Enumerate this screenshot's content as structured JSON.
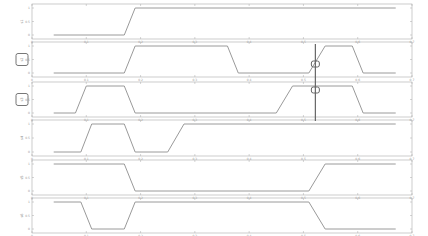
{
  "chart_data": [
    {
      "type": "line",
      "ylabel": "s1",
      "xlim": [
        0,
        0.7
      ],
      "ylim": [
        0,
        1
      ],
      "yticks": [
        "0",
        "0.5",
        "1"
      ],
      "xticks": [
        "0",
        "0.1",
        "0.2",
        "0.3",
        "0.4",
        "0.5",
        "0.6",
        "0.7"
      ],
      "x": [
        0.04,
        0.17,
        0.19,
        0.67
      ],
      "y": [
        0,
        0,
        1,
        1
      ],
      "boxed_label": false
    },
    {
      "type": "line",
      "ylabel": "s2",
      "xlim": [
        0,
        0.7
      ],
      "ylim": [
        0,
        1
      ],
      "yticks": [
        "0",
        "0.5",
        "1"
      ],
      "xticks": [
        "0",
        "0.1",
        "0.2",
        "0.3",
        "0.4",
        "0.5",
        "0.6",
        "0.7"
      ],
      "x": [
        0.04,
        0.17,
        0.19,
        0.36,
        0.38,
        0.51,
        0.54,
        0.59,
        0.61,
        0.67
      ],
      "y": [
        0,
        0,
        1,
        1,
        0,
        0,
        1,
        1,
        0,
        0
      ],
      "boxed_label": true
    },
    {
      "type": "line",
      "ylabel": "s3",
      "xlim": [
        0,
        0.7
      ],
      "ylim": [
        0,
        1
      ],
      "yticks": [
        "0",
        "0.5",
        "1"
      ],
      "xticks": [
        "0",
        "0.1",
        "0.2",
        "0.3",
        "0.4",
        "0.5",
        "0.6",
        "0.7"
      ],
      "x": [
        0.04,
        0.08,
        0.1,
        0.17,
        0.19,
        0.45,
        0.48,
        0.59,
        0.61,
        0.67
      ],
      "y": [
        0,
        0,
        1,
        1,
        0,
        0,
        1,
        1,
        0,
        0
      ],
      "boxed_label": true
    },
    {
      "type": "line",
      "ylabel": "s4",
      "xlim": [
        0,
        0.7
      ],
      "ylim": [
        0,
        1
      ],
      "yticks": [
        "0",
        "0.5",
        "1"
      ],
      "xticks": [
        "0",
        "0.1",
        "0.2",
        "0.3",
        "0.4",
        "0.5",
        "0.6",
        "0.7"
      ],
      "x": [
        0.04,
        0.09,
        0.11,
        0.17,
        0.19,
        0.25,
        0.28,
        0.67
      ],
      "y": [
        0,
        0,
        1,
        1,
        0,
        0,
        1,
        1
      ],
      "boxed_label": false
    },
    {
      "type": "line",
      "ylabel": "s5",
      "xlim": [
        0,
        0.7
      ],
      "ylim": [
        0,
        1
      ],
      "yticks": [
        "0",
        "0.5",
        "1"
      ],
      "xticks": [
        "0",
        "0.1",
        "0.2",
        "0.3",
        "0.4",
        "0.5",
        "0.6",
        "0.7"
      ],
      "x": [
        0.04,
        0.17,
        0.19,
        0.51,
        0.54,
        0.67
      ],
      "y": [
        1,
        1,
        0,
        0,
        1,
        1
      ],
      "boxed_label": false
    },
    {
      "type": "line",
      "ylabel": "s6",
      "xlim": [
        0,
        0.7
      ],
      "ylim": [
        0,
        1
      ],
      "yticks": [
        "0",
        "0.5",
        "1"
      ],
      "xticks": [
        "0",
        "0.1",
        "0.2",
        "0.3",
        "0.4",
        "0.5",
        "0.6",
        "0.7"
      ],
      "x": [
        0.04,
        0.09,
        0.11,
        0.17,
        0.19,
        0.51,
        0.54,
        0.67
      ],
      "y": [
        1,
        1,
        0,
        0,
        1,
        1,
        0,
        0
      ],
      "boxed_label": false
    }
  ],
  "cursor": {
    "x": 0.522,
    "from_panel": 1,
    "to_panel": 2,
    "marker_y_panel2": 0.5,
    "marker_y_panel3": 1
  },
  "colors": {
    "line": "#9a9a9a",
    "axis": "#aaaaaa",
    "cursor": "#666666",
    "box": "#777777"
  }
}
